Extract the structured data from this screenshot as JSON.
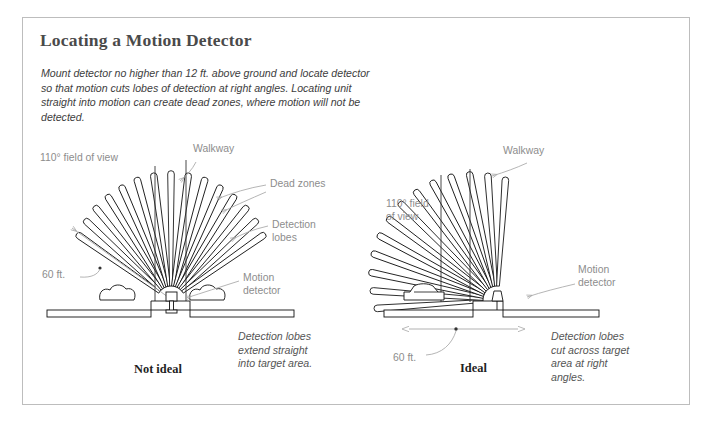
{
  "page": {
    "border_color": "#bdbdbd",
    "background": "#ffffff"
  },
  "header": {
    "title": "Locating a Motion Detector",
    "intro": "Mount detector no higher than 12 ft. above ground and locate detector so that motion cuts lobes of detection at right angles. Locating unit straight into motion can create dead zones, where motion will not be detected."
  },
  "left_diagram": {
    "name": "not-ideal",
    "caption_bold": "Not ideal",
    "caption_italic": "Detection lobes\nextend straight\ninto target area.",
    "labels": {
      "fov": "110° field of view",
      "walkway": "Walkway",
      "dead_zones": "Dead zones",
      "detection_lobes": "Detection\nlobes",
      "range": "60 ft.",
      "motion_detector": "Motion\ndetector"
    },
    "geometry": {
      "detector_x": 171,
      "detector_y": 300,
      "lobe_count": 15,
      "fan_start_deg": 215,
      "fan_end_deg": 325,
      "lobe_length": 118,
      "field_of_view_deg": 110
    }
  },
  "right_diagram": {
    "name": "ideal",
    "caption_bold": "Ideal",
    "caption_italic": "Detection lobes\ncut across target\narea at right\nangles.",
    "labels": {
      "fov": "110° field\nof view",
      "walkway": "Walkway",
      "range": "60 ft.",
      "motion_detector": "Motion\ndetector"
    },
    "geometry": {
      "detector_x": 497,
      "detector_y": 300,
      "lobe_count": 13,
      "fan_start_deg": 185,
      "fan_end_deg": 283,
      "lobe_length": 128,
      "field_of_view_deg": 110
    }
  },
  "colors": {
    "ink": "#111111",
    "label_gray": "#8d8d8d",
    "leader_gray": "#a8a8a8",
    "title_gray": "#4a4a4a"
  }
}
